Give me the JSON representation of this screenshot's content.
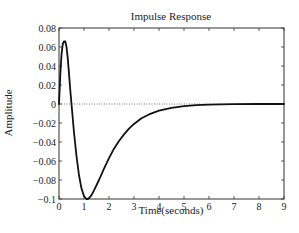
{
  "chart_data": {
    "type": "line",
    "title": "Impulse Response",
    "xlabel": "Time(seconds)",
    "ylabel": "Amplitude",
    "xlim": [
      0,
      9
    ],
    "ylim": [
      -0.1,
      0.08
    ],
    "xticks": [
      0,
      1,
      2,
      3,
      4,
      5,
      6,
      7,
      8,
      9
    ],
    "xtick_labels": [
      "0",
      "1",
      "2",
      "3",
      "4",
      "5",
      "6",
      "7",
      "8",
      "9"
    ],
    "yticks": [
      -0.1,
      -0.08,
      -0.06,
      -0.04,
      -0.02,
      0,
      0.02,
      0.04,
      0.06,
      0.08
    ],
    "ytick_labels": [
      "−0.1",
      "−0.08",
      "−0.06",
      "−0.04",
      "−0.02",
      "0",
      "0.02",
      "0.04",
      "0.06",
      "0.08"
    ],
    "grid": false,
    "reference_line": {
      "y": 0,
      "style": "dotted"
    },
    "series": [
      {
        "name": "impulse response",
        "color": "#111111",
        "x": [
          0,
          0.05,
          0.1,
          0.15,
          0.2,
          0.25,
          0.3,
          0.35,
          0.4,
          0.45,
          0.5,
          0.6,
          0.7,
          0.8,
          0.9,
          1.0,
          1.1,
          1.15,
          1.2,
          1.3,
          1.4,
          1.6,
          1.8,
          2.0,
          2.2,
          2.4,
          2.6,
          2.8,
          3.0,
          3.3,
          3.6,
          4.0,
          4.5,
          5.0,
          5.5,
          6.0,
          6.5,
          7.0,
          8.0,
          9.0
        ],
        "values": [
          0,
          0.03,
          0.052,
          0.063,
          0.066,
          0.066,
          0.06,
          0.048,
          0.032,
          0.015,
          0.0,
          -0.03,
          -0.055,
          -0.075,
          -0.089,
          -0.097,
          -0.1,
          -0.1,
          -0.099,
          -0.096,
          -0.091,
          -0.08,
          -0.068,
          -0.057,
          -0.047,
          -0.039,
          -0.032,
          -0.026,
          -0.021,
          -0.015,
          -0.011,
          -0.007,
          -0.004,
          -0.0022,
          -0.0012,
          -0.0006,
          -0.0003,
          -0.0001,
          0,
          0
        ]
      }
    ]
  },
  "colors": {
    "line": "#111111",
    "axes": "#333333",
    "zero_line": "#555555",
    "background": "#ffffff"
  }
}
